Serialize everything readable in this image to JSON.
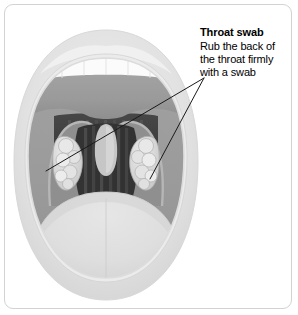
{
  "figure": {
    "alt_title": "Throat swab technique diagram",
    "frame": {
      "border_color": "#d3d3d3",
      "background": "#ffffff"
    }
  },
  "callout": {
    "title": "Throat swab",
    "body_lines": [
      "Rub the back of",
      "the throat firmly",
      "with a swab"
    ],
    "leader_lines": {
      "count": 2,
      "color": "#1a1a1a",
      "converge_x": 204,
      "converge_y": 78,
      "target_left_x": 46,
      "target_left_y": 171,
      "target_right_x": 150,
      "target_right_y": 179
    }
  },
  "anatomy": {
    "parts": [
      {
        "name": "lips",
        "label": "Lips",
        "color": "#e3e3e3"
      },
      {
        "name": "inner-lip",
        "label": "Inner lip",
        "color": "#efefef"
      },
      {
        "name": "upper-teeth",
        "label": "Upper teeth",
        "color": "#fafafa"
      },
      {
        "name": "hard-palate",
        "label": "Hard palate",
        "color": "#9a9a9a"
      },
      {
        "name": "soft-palate",
        "label": "Soft palate",
        "color": "#b4b4b4"
      },
      {
        "name": "palatine-arch-left",
        "label": "Left palatine arch",
        "color": "#8d8d8d"
      },
      {
        "name": "palatine-arch-right",
        "label": "Right palatine arch",
        "color": "#8d8d8d"
      },
      {
        "name": "tonsil-left",
        "label": "Left tonsil",
        "color": "#d8d8d8"
      },
      {
        "name": "tonsil-right",
        "label": "Right tonsil",
        "color": "#d8d8d8"
      },
      {
        "name": "uvula",
        "label": "Uvula",
        "color": "#c8c8c8"
      },
      {
        "name": "pharynx",
        "label": "Back of throat (pharynx)",
        "color": "#3a3a3a"
      },
      {
        "name": "tongue",
        "label": "Tongue",
        "color": "#dedede"
      }
    ]
  },
  "colors": {
    "frame_border": "#d3d3d3",
    "lip_outer": "#e3e3e3",
    "lip_inner": "#efefef",
    "teeth": "#fafafa",
    "palate": "#9a9a9a",
    "throat_dark": "#3a3a3a",
    "tongue": "#dedede",
    "text": "#000000",
    "leader": "#1a1a1a"
  }
}
